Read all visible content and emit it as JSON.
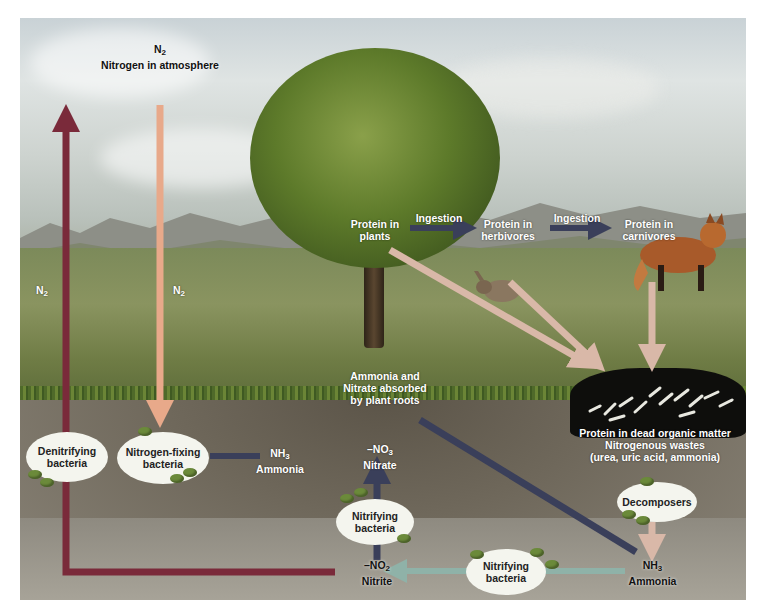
{
  "diagram": {
    "atmosphere": {
      "formula": "N",
      "subscript": "2",
      "label": "Nitrogen in atmosphere"
    },
    "left_arrow_labels": [
      {
        "formula": "N",
        "subscript": "2"
      },
      {
        "formula": "N",
        "subscript": "2"
      }
    ],
    "food_chain": {
      "plants": [
        "Protein in",
        "plants"
      ],
      "herbivores": [
        "Protein in",
        "herbivores"
      ],
      "carnivores": [
        "Protein in",
        "carnivores"
      ],
      "ingestion_1": "Ingestion",
      "ingestion_2": "Ingestion"
    },
    "roots_label": [
      "Ammonia and",
      "Nitrate absorbed",
      "by plant roots"
    ],
    "dead_matter": [
      "Protein in dead organic matter",
      "Nitrogenous wastes",
      "(urea, uric acid, ammonia)"
    ],
    "ammonia_mid": {
      "formula": "NH",
      "subscript": "3",
      "label": "Ammonia"
    },
    "nitrate": {
      "formula": "–NO",
      "subscript": "3",
      "label": "Nitrate"
    },
    "nitrite": {
      "formula": "–NO",
      "subscript": "2",
      "label": "Nitrite"
    },
    "ammonia_right": {
      "formula": "NH",
      "subscript": "3",
      "label": "Ammonia"
    },
    "bacteria": {
      "denitrifying": [
        "Denitrifying",
        "bacteria"
      ],
      "nitrogen_fixing": [
        "Nitrogen-fixing",
        "bacteria"
      ],
      "nitrifying_upper": [
        "Nitrifying",
        "bacteria"
      ],
      "nitrifying_lower": [
        "Nitrifying",
        "bacteria"
      ],
      "decomposers": [
        "Decomposers"
      ]
    },
    "colors": {
      "denitrification_arrow": "#7a2a3a",
      "fixation_arrow": "#e8a98a",
      "ingestion_arrow": "#3a3f5a",
      "decay_arrow": "#d9b8a8",
      "nitrification_arrow": "#8fb2a8",
      "ammonia_flow": "#3a3f5a",
      "bacteria_pellet": "#6b8a3a"
    }
  }
}
